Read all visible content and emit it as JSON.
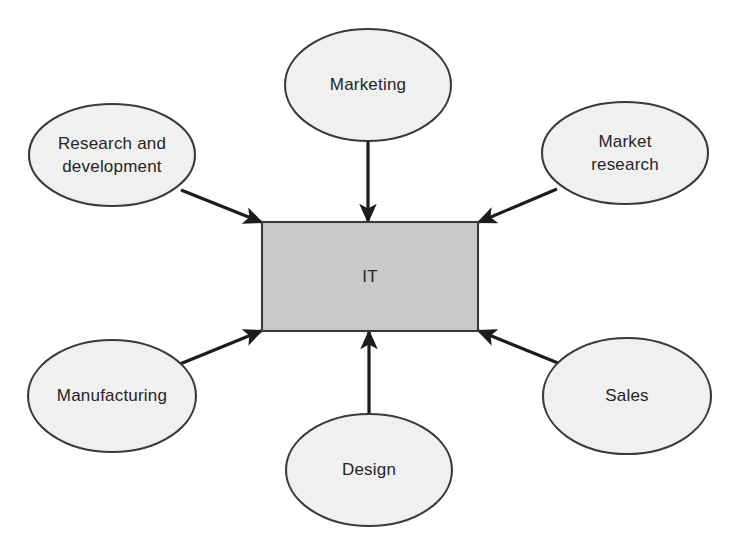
{
  "diagram": {
    "type": "hub-and-spoke",
    "title": "",
    "canvas": {
      "width": 734,
      "height": 551,
      "background": "#ffffff"
    },
    "colors": {
      "hub_fill": "#c9c9c9",
      "node_fill": "#f0f0f0",
      "stroke": "#3a3a3a",
      "arrow": "#1c1c1c",
      "text": "#252525"
    },
    "hub": {
      "id": "it",
      "label": "IT",
      "shape": "rectangle",
      "x": 262,
      "y": 222,
      "width": 216,
      "height": 109
    },
    "nodes": [
      {
        "id": "marketing",
        "label": "Marketing",
        "lines": [
          "Marketing"
        ],
        "shape": "ellipse",
        "cx": 368,
        "cy": 85,
        "rx": 83,
        "ry": 56,
        "position": "top"
      },
      {
        "id": "research-and-development",
        "label": "Research and development",
        "lines": [
          "Research and",
          "development"
        ],
        "shape": "ellipse",
        "cx": 112,
        "cy": 155,
        "rx": 83,
        "ry": 51,
        "position": "top-left"
      },
      {
        "id": "market-research",
        "label": "Market research",
        "lines": [
          "Market",
          "research"
        ],
        "shape": "ellipse",
        "cx": 625,
        "cy": 153,
        "rx": 83,
        "ry": 51,
        "position": "top-right"
      },
      {
        "id": "manufacturing",
        "label": "Manufacturing",
        "lines": [
          "Manufacturing"
        ],
        "shape": "ellipse",
        "cx": 112,
        "cy": 396,
        "rx": 84,
        "ry": 56,
        "position": "bottom-left"
      },
      {
        "id": "sales",
        "label": "Sales",
        "lines": [
          "Sales"
        ],
        "shape": "ellipse",
        "cx": 627,
        "cy": 396,
        "rx": 84,
        "ry": 58,
        "position": "bottom-right"
      },
      {
        "id": "design",
        "label": "Design",
        "lines": [
          "Design"
        ],
        "shape": "ellipse",
        "cx": 369,
        "cy": 470,
        "rx": 83,
        "ry": 56,
        "position": "bottom"
      }
    ],
    "edges": [
      {
        "id": "edge-marketing-it",
        "from": "marketing",
        "to": "it",
        "x1": 368,
        "y1": 141,
        "x2": 368,
        "y2": 221,
        "arrowhead": "to"
      },
      {
        "id": "edge-rnd-it",
        "from": "research-and-development",
        "to": "it",
        "x1": 181,
        "y1": 190,
        "x2": 261,
        "y2": 222,
        "arrowhead": "to"
      },
      {
        "id": "edge-market-research-it",
        "from": "market-research",
        "to": "it",
        "x1": 557,
        "y1": 189,
        "x2": 479,
        "y2": 222,
        "arrowhead": "to"
      },
      {
        "id": "edge-manufacturing-it",
        "from": "manufacturing",
        "to": "it",
        "x1": 180,
        "y1": 364,
        "x2": 261,
        "y2": 331,
        "arrowhead": "to"
      },
      {
        "id": "edge-sales-it",
        "from": "sales",
        "to": "it",
        "x1": 558,
        "y1": 363,
        "x2": 479,
        "y2": 331,
        "arrowhead": "to"
      },
      {
        "id": "edge-design-it",
        "from": "design",
        "to": "it",
        "x1": 369,
        "y1": 414,
        "x2": 369,
        "y2": 332,
        "arrowhead": "to"
      }
    ]
  }
}
